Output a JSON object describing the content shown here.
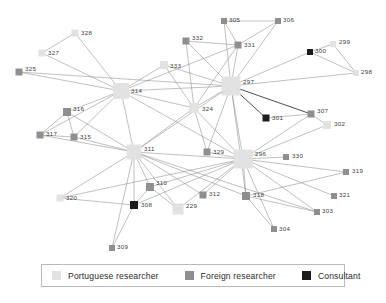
{
  "figure": {
    "type": "network-diagram",
    "title": "",
    "width": 386,
    "height": 303,
    "background": "#ffffff"
  },
  "categories": {
    "portuguese": {
      "key": "portuguese",
      "label": "Portuguese researcher",
      "color": "#e2e2e2"
    },
    "foreign": {
      "key": "foreign",
      "label": "Foreign researcher",
      "color": "#8f8f8f"
    },
    "consultant": {
      "key": "consultant",
      "label": "Consultant",
      "color": "#1c1c1c"
    }
  },
  "legend": {
    "position": "bottom",
    "items": [
      {
        "label": "Portuguese researcher",
        "color": "#e2e2e2",
        "swatch": "portuguese-swatch"
      },
      {
        "label": "Foreign researcher",
        "color": "#8f8f8f",
        "swatch": "foreign-swatch"
      },
      {
        "label": "Consultant",
        "color": "#1c1c1c",
        "swatch": "consultant-swatch"
      }
    ]
  },
  "chart_data": {
    "type": "network",
    "node_count": 34,
    "edge_count": 74,
    "nodes": [
      {
        "id": "328",
        "label": "328",
        "x": 75,
        "y": 33,
        "size": 7,
        "category": "portuguese",
        "label_dx": 6,
        "label_dy": 2
      },
      {
        "id": "327",
        "label": "327",
        "x": 42,
        "y": 53,
        "size": 7,
        "category": "portuguese",
        "label_dx": 6,
        "label_dy": 2
      },
      {
        "id": "325",
        "label": "325",
        "x": 19,
        "y": 72,
        "size": 7,
        "category": "foreign",
        "label_dx": 6,
        "label_dy": -1
      },
      {
        "id": "305",
        "label": "305",
        "x": 224,
        "y": 21,
        "size": 6,
        "category": "foreign",
        "label_dx": 5,
        "label_dy": 1
      },
      {
        "id": "306",
        "label": "306",
        "x": 278,
        "y": 21,
        "size": 6,
        "category": "foreign",
        "label_dx": 5,
        "label_dy": 1
      },
      {
        "id": "332",
        "label": "332",
        "x": 186,
        "y": 41,
        "size": 7,
        "category": "foreign",
        "label_dx": 6,
        "label_dy": -1
      },
      {
        "id": "331",
        "label": "331",
        "x": 238,
        "y": 45,
        "size": 7,
        "category": "foreign",
        "label_dx": 6,
        "label_dy": 2
      },
      {
        "id": "299",
        "label": "299",
        "x": 333,
        "y": 44,
        "size": 6,
        "category": "portuguese",
        "label_dx": 6,
        "label_dy": 0
      },
      {
        "id": "300",
        "label": "300",
        "x": 310,
        "y": 52,
        "size": 6,
        "category": "consultant",
        "label_dx": 5,
        "label_dy": 1
      },
      {
        "id": "298",
        "label": "298",
        "x": 356,
        "y": 73,
        "size": 6,
        "category": "portuguese",
        "label_dx": 5,
        "label_dy": 1
      },
      {
        "id": "333",
        "label": "333",
        "x": 164,
        "y": 65,
        "size": 8,
        "category": "portuguese",
        "label_dx": 6,
        "label_dy": 3
      },
      {
        "id": "314",
        "label": "314",
        "x": 121,
        "y": 91,
        "size": 16,
        "category": "portuguese",
        "label_dx": 10,
        "label_dy": 2
      },
      {
        "id": "297",
        "label": "297",
        "x": 231,
        "y": 86,
        "size": 19,
        "category": "portuguese",
        "label_dx": 12,
        "label_dy": -2
      },
      {
        "id": "324",
        "label": "324",
        "x": 194,
        "y": 108,
        "size": 10,
        "category": "portuguese",
        "label_dx": 8,
        "label_dy": 3
      },
      {
        "id": "301",
        "label": "301",
        "x": 266,
        "y": 118,
        "size": 7,
        "category": "consultant",
        "label_dx": 6,
        "label_dy": 2
      },
      {
        "id": "307",
        "label": "307",
        "x": 311,
        "y": 114,
        "size": 7,
        "category": "foreign",
        "label_dx": 6,
        "label_dy": -1
      },
      {
        "id": "302",
        "label": "302",
        "x": 327,
        "y": 125,
        "size": 8,
        "category": "portuguese",
        "label_dx": 7,
        "label_dy": 1
      },
      {
        "id": "316",
        "label": "316",
        "x": 67,
        "y": 112,
        "size": 8,
        "category": "foreign",
        "label_dx": 6,
        "label_dy": -1
      },
      {
        "id": "317",
        "label": "317",
        "x": 40,
        "y": 135,
        "size": 7,
        "category": "foreign",
        "label_dx": 6,
        "label_dy": 1
      },
      {
        "id": "315",
        "label": "315",
        "x": 74,
        "y": 137,
        "size": 7,
        "category": "foreign",
        "label_dx": 6,
        "label_dy": 2
      },
      {
        "id": "311",
        "label": "311",
        "x": 134,
        "y": 152,
        "size": 15,
        "category": "portuguese",
        "label_dx": 10,
        "label_dy": -1
      },
      {
        "id": "329",
        "label": "329",
        "x": 207,
        "y": 152,
        "size": 7,
        "category": "foreign",
        "label_dx": 6,
        "label_dy": 2
      },
      {
        "id": "296",
        "label": "296",
        "x": 243,
        "y": 159,
        "size": 19,
        "category": "portuguese",
        "label_dx": 12,
        "label_dy": -3
      },
      {
        "id": "330",
        "label": "330",
        "x": 286,
        "y": 157,
        "size": 6,
        "category": "foreign",
        "label_dx": 6,
        "label_dy": 1
      },
      {
        "id": "319",
        "label": "319",
        "x": 346,
        "y": 172,
        "size": 6,
        "category": "foreign",
        "label_dx": 6,
        "label_dy": 1
      },
      {
        "id": "310",
        "label": "310",
        "x": 150,
        "y": 187,
        "size": 8,
        "category": "foreign",
        "label_dx": 6,
        "label_dy": -2
      },
      {
        "id": "312",
        "label": "312",
        "x": 203,
        "y": 195,
        "size": 7,
        "category": "foreign",
        "label_dx": 6,
        "label_dy": 1
      },
      {
        "id": "318",
        "label": "318",
        "x": 246,
        "y": 196,
        "size": 8,
        "category": "foreign",
        "label_dx": 7,
        "label_dy": 1
      },
      {
        "id": "321",
        "label": "321",
        "x": 334,
        "y": 196,
        "size": 6,
        "category": "foreign",
        "label_dx": 5,
        "label_dy": 1
      },
      {
        "id": "320",
        "label": "320",
        "x": 60,
        "y": 198,
        "size": 7,
        "category": "portuguese",
        "label_dx": 6,
        "label_dy": 2
      },
      {
        "id": "308",
        "label": "308",
        "x": 134,
        "y": 205,
        "size": 8,
        "category": "consultant",
        "label_dx": 7,
        "label_dy": 2
      },
      {
        "id": "229",
        "label": "229",
        "x": 178,
        "y": 209,
        "size": 11,
        "category": "portuguese",
        "label_dx": 8,
        "label_dy": -1
      },
      {
        "id": "303",
        "label": "303",
        "x": 317,
        "y": 212,
        "size": 6,
        "category": "foreign",
        "label_dx": 5,
        "label_dy": 1
      },
      {
        "id": "304",
        "label": "304",
        "x": 274,
        "y": 229,
        "size": 6,
        "category": "foreign",
        "label_dx": 5,
        "label_dy": 2
      },
      {
        "id": "309",
        "label": "309",
        "x": 112,
        "y": 248,
        "size": 6,
        "category": "foreign",
        "label_dx": 5,
        "label_dy": 1
      }
    ],
    "edges": [
      {
        "source": "328",
        "target": "327"
      },
      {
        "source": "328",
        "target": "314"
      },
      {
        "source": "327",
        "target": "314"
      },
      {
        "source": "325",
        "target": "314"
      },
      {
        "source": "325",
        "target": "297"
      },
      {
        "source": "305",
        "target": "306"
      },
      {
        "source": "305",
        "target": "297"
      },
      {
        "source": "305",
        "target": "331"
      },
      {
        "source": "306",
        "target": "331"
      },
      {
        "source": "306",
        "target": "297"
      },
      {
        "source": "332",
        "target": "331"
      },
      {
        "source": "332",
        "target": "297"
      },
      {
        "source": "332",
        "target": "324"
      },
      {
        "source": "331",
        "target": "297"
      },
      {
        "source": "331",
        "target": "314"
      },
      {
        "source": "331",
        "target": "324"
      },
      {
        "source": "299",
        "target": "300"
      },
      {
        "source": "299",
        "target": "298"
      },
      {
        "source": "300",
        "target": "298"
      },
      {
        "source": "300",
        "target": "297"
      },
      {
        "source": "298",
        "target": "297"
      },
      {
        "source": "333",
        "target": "314"
      },
      {
        "source": "333",
        "target": "297"
      },
      {
        "source": "333",
        "target": "324"
      },
      {
        "source": "314",
        "target": "297"
      },
      {
        "source": "314",
        "target": "324"
      },
      {
        "source": "314",
        "target": "311"
      },
      {
        "source": "314",
        "target": "316"
      },
      {
        "source": "314",
        "target": "315"
      },
      {
        "source": "314",
        "target": "317"
      },
      {
        "source": "314",
        "target": "296"
      },
      {
        "source": "297",
        "target": "324"
      },
      {
        "source": "297",
        "target": "301",
        "strong": true
      },
      {
        "source": "297",
        "target": "307",
        "strong": true
      },
      {
        "source": "297",
        "target": "296"
      },
      {
        "source": "297",
        "target": "329"
      },
      {
        "source": "297",
        "target": "311"
      },
      {
        "source": "297",
        "target": "318"
      },
      {
        "source": "324",
        "target": "296"
      },
      {
        "source": "324",
        "target": "329"
      },
      {
        "source": "324",
        "target": "311"
      },
      {
        "source": "301",
        "target": "307"
      },
      {
        "source": "307",
        "target": "302"
      },
      {
        "source": "307",
        "target": "296"
      },
      {
        "source": "302",
        "target": "296"
      },
      {
        "source": "316",
        "target": "317"
      },
      {
        "source": "316",
        "target": "315"
      },
      {
        "source": "316",
        "target": "311"
      },
      {
        "source": "317",
        "target": "315"
      },
      {
        "source": "317",
        "target": "311"
      },
      {
        "source": "315",
        "target": "311"
      },
      {
        "source": "311",
        "target": "296"
      },
      {
        "source": "311",
        "target": "310"
      },
      {
        "source": "311",
        "target": "308"
      },
      {
        "source": "311",
        "target": "320"
      },
      {
        "source": "311",
        "target": "229"
      },
      {
        "source": "311",
        "target": "312"
      },
      {
        "source": "311",
        "target": "318"
      },
      {
        "source": "311",
        "target": "309"
      },
      {
        "source": "311",
        "target": "303"
      },
      {
        "source": "329",
        "target": "296"
      },
      {
        "source": "296",
        "target": "330"
      },
      {
        "source": "296",
        "target": "319"
      },
      {
        "source": "296",
        "target": "321"
      },
      {
        "source": "296",
        "target": "318"
      },
      {
        "source": "296",
        "target": "312"
      },
      {
        "source": "296",
        "target": "310"
      },
      {
        "source": "296",
        "target": "320"
      },
      {
        "source": "296",
        "target": "308"
      },
      {
        "source": "296",
        "target": "304"
      },
      {
        "source": "296",
        "target": "303"
      },
      {
        "source": "296",
        "target": "229"
      },
      {
        "source": "318",
        "target": "303"
      },
      {
        "source": "318",
        "target": "304"
      },
      {
        "source": "318",
        "target": "319"
      },
      {
        "source": "310",
        "target": "308"
      },
      {
        "source": "310",
        "target": "229"
      },
      {
        "source": "308",
        "target": "309"
      },
      {
        "source": "320",
        "target": "308"
      }
    ]
  }
}
